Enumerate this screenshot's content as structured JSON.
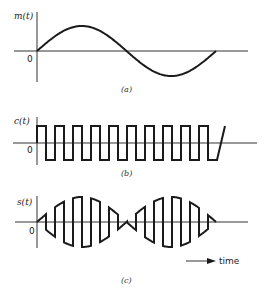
{
  "figure": {
    "panels": [
      {
        "id": "a",
        "signal_label": "m(t)",
        "origin_label": "0",
        "caption": "(a)",
        "description": "Message signal: one full period of a sinusoid"
      },
      {
        "id": "b",
        "signal_label": "c(t)",
        "origin_label": "0",
        "caption": "(b)",
        "description": "Carrier: bipolar square wave, ~10 periods"
      },
      {
        "id": "c",
        "signal_label": "s(t)",
        "origin_label": "0",
        "caption": "(c)",
        "description": "Product s(t) = m(t)·c(t), square-wave-modulated sinusoid"
      }
    ],
    "time_axis_label": "time",
    "colors": {
      "background": "#ffffff",
      "ink": "#1a1a1a"
    }
  }
}
